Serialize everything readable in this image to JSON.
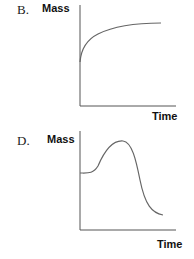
{
  "panels": [
    {
      "letter": "B.",
      "ylabel": "Mass",
      "xlabel": "Time",
      "curve": "rapid rise then plateau (logarithmic-like increase)"
    },
    {
      "letter": "D.",
      "ylabel": "Mass",
      "xlabel": "Time",
      "curve": "flat, rises to a peak, then falls sharply below starting level"
    }
  ],
  "colors": {
    "axis": "#555555",
    "curve": "#666666",
    "text": "#111111"
  }
}
